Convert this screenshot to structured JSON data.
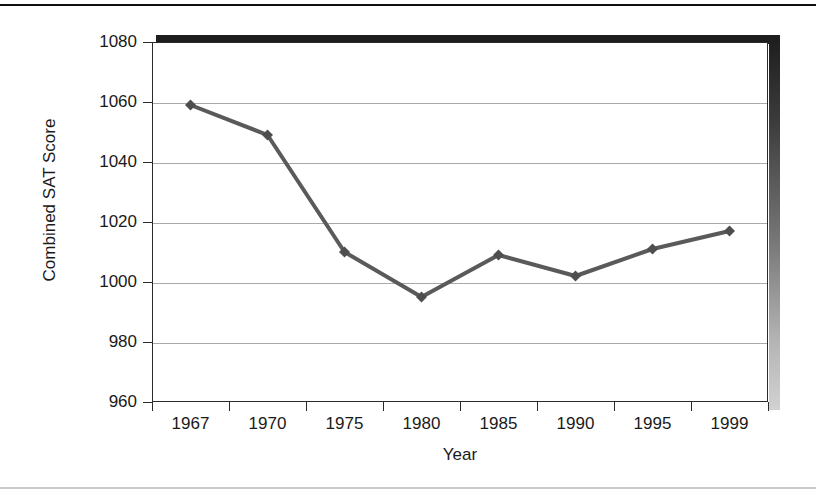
{
  "chart_data": {
    "type": "line",
    "title": "",
    "xlabel": "Year",
    "ylabel": "Combined SAT Score",
    "categories": [
      "1967",
      "1970",
      "1975",
      "1980",
      "1985",
      "1990",
      "1995",
      "1999"
    ],
    "values": [
      1059,
      1049,
      1010,
      995,
      1009,
      1002,
      1011,
      1017
    ],
    "series": [
      {
        "name": "Combined SAT Score",
        "values": [
          1059,
          1049,
          1010,
          995,
          1009,
          1002,
          1011,
          1017
        ]
      }
    ],
    "ylim": [
      960,
      1080
    ],
    "ytick_labels": [
      "1080",
      "1060",
      "1040",
      "1020",
      "1000",
      "980",
      "960"
    ],
    "ytick_values": [
      1080,
      1060,
      1040,
      1020,
      1000,
      980,
      960
    ],
    "grid": true,
    "grid_axis": "y",
    "legend": false,
    "legend_position": "none",
    "marker": "diamond",
    "line_color": "#5a5a5a",
    "marker_color": "#4e4e4e",
    "grid_color": "#a9a9a9",
    "frame_color": "#2b2b2b",
    "background": "#ffffff"
  },
  "axis": {
    "y_title": "Combined SAT Score",
    "x_title": "Year"
  }
}
